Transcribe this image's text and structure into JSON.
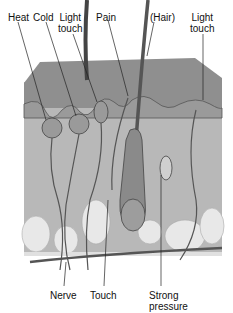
{
  "diagram": {
    "top_labels": [
      {
        "id": "heat",
        "text": "Heat"
      },
      {
        "id": "cold",
        "text": "Cold"
      },
      {
        "id": "light_touch_1",
        "line1": "Light",
        "line2": "touch"
      },
      {
        "id": "pain",
        "text": "Pain"
      },
      {
        "id": "hair",
        "text": "(Hair)"
      },
      {
        "id": "light_touch_2",
        "line1": "Light",
        "line2": "touch"
      }
    ],
    "bottom_labels": [
      {
        "id": "nerve",
        "text": "Nerve"
      },
      {
        "id": "touch",
        "text": "Touch"
      },
      {
        "id": "strong_pressure",
        "line1": "Strong",
        "line2": "pressure"
      }
    ],
    "colors": {
      "epidermis": "#8c8c8c",
      "dermis": "#b9b9b9",
      "fat": "#e6e6e6",
      "line": "#3a3a3a",
      "text": "#111111"
    }
  }
}
